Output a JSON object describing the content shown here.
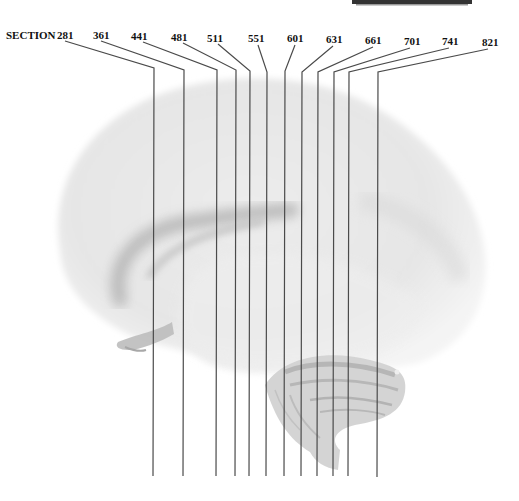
{
  "figure": {
    "title_fragment": "SECTION PLANES",
    "prefix_label": "SECTION",
    "line_color": "#4a4a4a",
    "brain_tone": "#e8e8e8",
    "brain_shadow": "#b8b8b8",
    "cerebellum_tone": "#cfcfcf"
  },
  "sections": [
    {
      "label": "281",
      "lx": 57,
      "ly": 30,
      "x1": 65,
      "y1": 41,
      "ex": 154,
      "ey": 68,
      "bottom": 476
    },
    {
      "label": "361",
      "lx": 93,
      "ly": 30,
      "x1": 101,
      "y1": 41,
      "ex": 184,
      "ey": 70,
      "bottom": 476
    },
    {
      "label": "441",
      "lx": 131,
      "ly": 31,
      "x1": 143,
      "y1": 42,
      "ex": 217,
      "ey": 70,
      "bottom": 476
    },
    {
      "label": "481",
      "lx": 171,
      "ly": 32,
      "x1": 183,
      "y1": 43,
      "ex": 236,
      "ey": 70,
      "bottom": 476
    },
    {
      "label": "511",
      "lx": 207,
      "ly": 33,
      "x1": 218,
      "y1": 44,
      "ex": 250,
      "ey": 71,
      "bottom": 476
    },
    {
      "label": "551",
      "lx": 248,
      "ly": 33,
      "x1": 258,
      "y1": 45,
      "ex": 267,
      "ey": 72,
      "bottom": 476
    },
    {
      "label": "601",
      "lx": 287,
      "ly": 33,
      "x1": 295,
      "y1": 45,
      "ex": 285,
      "ey": 71,
      "bottom": 476
    },
    {
      "label": "631",
      "lx": 326,
      "ly": 34,
      "x1": 333,
      "y1": 46,
      "ex": 302,
      "ey": 72,
      "bottom": 476
    },
    {
      "label": "661",
      "lx": 365,
      "ly": 35,
      "x1": 373,
      "y1": 47,
      "ex": 318,
      "ey": 72,
      "bottom": 476
    },
    {
      "label": "701",
      "lx": 404,
      "ly": 36,
      "x1": 410,
      "y1": 48,
      "ex": 334,
      "ey": 72,
      "bottom": 476
    },
    {
      "label": "741",
      "lx": 442,
      "ly": 36,
      "x1": 449,
      "y1": 48,
      "ex": 349,
      "ey": 72,
      "bottom": 476
    },
    {
      "label": "821",
      "lx": 482,
      "ly": 37,
      "x1": 488,
      "y1": 49,
      "ex": 378,
      "ey": 72,
      "bottom": 477
    }
  ]
}
